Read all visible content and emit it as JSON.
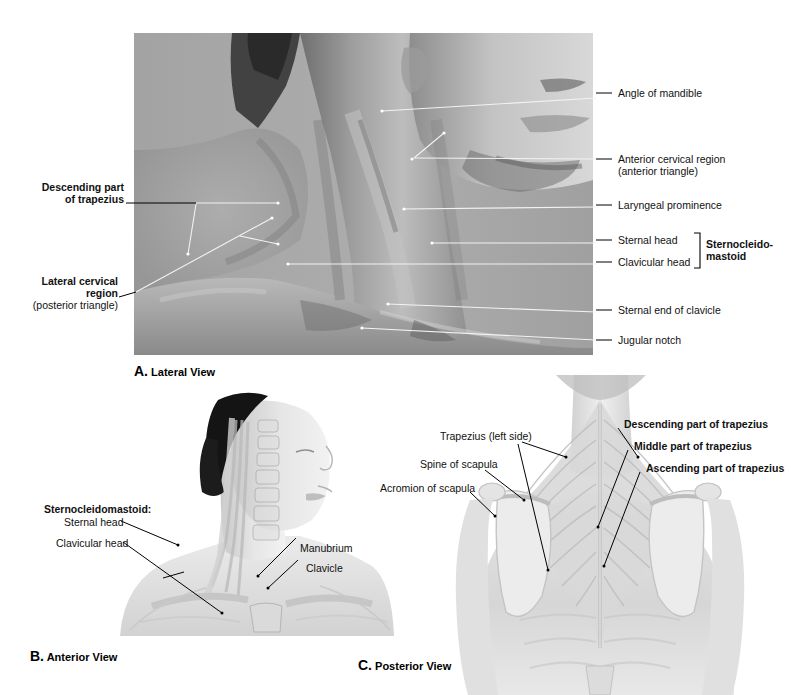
{
  "figure": {
    "background_color": "#ffffff",
    "photo_gray": "#a8a8a8"
  },
  "panels": [
    {
      "id": "A",
      "caption_letter": "A.",
      "caption_text": "Lateral View",
      "image_kind": "grayscale-photograph",
      "image_description": "Lateral (side) photograph of a male head, neck and shoulder on a flat gray studio background; jaw, chin, beard stubble, sternocleidomastoid and trapezius contours visible.",
      "labels_left": [
        {
          "name": "descending-part-of-trapezius",
          "lines": [
            "Descending part",
            "of trapezius"
          ],
          "bold": true,
          "align": "right"
        },
        {
          "name": "lateral-cervical-region",
          "lines": [
            "Lateral cervical",
            "region"
          ],
          "sub": "(posterior triangle)",
          "bold": true,
          "align": "right"
        }
      ],
      "labels_right": [
        {
          "name": "angle-of-mandible",
          "text": "Angle of mandible",
          "bold": false
        },
        {
          "name": "anterior-cervical-region",
          "text": "Anterior cervical region",
          "sub": "(anterior triangle)",
          "bold": true
        },
        {
          "name": "laryngeal-prominence",
          "text": "Laryngeal prominence",
          "bold": false
        },
        {
          "name": "sternal-head",
          "text": "Sternal head",
          "bold": false
        },
        {
          "name": "clavicular-head",
          "text": "Clavicular head",
          "bold": false
        },
        {
          "name": "sternal-end-of-clavicle",
          "text": "Sternal end of clavicle",
          "bold": false
        },
        {
          "name": "jugular-notch",
          "text": "Jugular notch",
          "bold": false
        }
      ],
      "bracket_label": {
        "name": "sternocleidomastoid",
        "lines": [
          "Sternocleido-",
          "mastoid"
        ],
        "bold": true
      }
    },
    {
      "id": "B",
      "caption_letter": "B.",
      "caption_text": "Anterior View",
      "image_kind": "grayscale-anatomical-overlay",
      "image_description": "Anterior three-quarter view of a woman's head, neck and upper thorax with translucent overlay of cervical vertebrae, sternocleidomastoid muscle, clavicles, manubrium and ribs; dark hair tied back.",
      "labels": [
        {
          "name": "sternocleidomastoid-heading",
          "text": "Sternocleidomastoid:",
          "bold": true
        },
        {
          "name": "sternal-head",
          "text": "Sternal head",
          "bold": false
        },
        {
          "name": "clavicular-head",
          "text": "Clavicular head",
          "bold": false
        },
        {
          "name": "manubrium",
          "text": "Manubrium",
          "bold": false
        },
        {
          "name": "clavicle",
          "text": "Clavicle",
          "bold": false
        }
      ]
    },
    {
      "id": "C",
      "caption_letter": "C.",
      "caption_text": "Posterior View",
      "image_kind": "grayscale-anatomical-overlay",
      "image_description": "Posterior view of the upper back and neck with translucent overlay showing the trapezius muscle fibers, scapulae, ribs and vertebral column.",
      "labels_left": [
        {
          "name": "trapezius-left-side",
          "text": "Trapezius",
          "suffix": " (left side)",
          "bold": true
        },
        {
          "name": "spine-of-scapula",
          "text": "Spine of scapula",
          "bold": false
        },
        {
          "name": "acromion-of-scapula",
          "text": "Acromion of scapula",
          "bold": false
        }
      ],
      "labels_right": [
        {
          "name": "descending-part-of-trapezius",
          "text": "Descending part of trapezius",
          "bold": true
        },
        {
          "name": "middle-part-of-trapezius",
          "text": "Middle part of trapezius",
          "bold": true
        },
        {
          "name": "ascending-part-of-trapezius",
          "text": "Ascending part of trapezius",
          "bold": true
        }
      ]
    }
  ]
}
